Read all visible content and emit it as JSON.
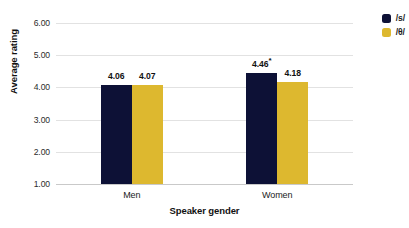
{
  "chart_data": {
    "type": "bar",
    "title": "",
    "xlabel": "Speaker gender",
    "ylabel": "Average rating",
    "categories": [
      "Men",
      "Women"
    ],
    "series": [
      {
        "name": "/s/",
        "color": "#0d1136",
        "values": [
          4.06,
          4.07
        ],
        "labels": [
          "4.06",
          "4.07"
        ],
        "annotations": [
          null,
          null
        ]
      },
      {
        "name": "/θ/",
        "color": "#ddb82f",
        "values": [
          4.07,
          4.18
        ],
        "labels": [
          "4.07",
          "4.18"
        ],
        "annotations": [
          null,
          null
        ]
      }
    ],
    "bars": [
      {
        "category": "Men",
        "series": "/s/",
        "value": 4.06,
        "label": "4.06",
        "star": ""
      },
      {
        "category": "Men",
        "series": "/θ/",
        "value": 4.07,
        "label": "4.07",
        "star": ""
      },
      {
        "category": "Women",
        "series": "/s/",
        "value": 4.46,
        "label": "4.46",
        "star": "*"
      },
      {
        "category": "Women",
        "series": "/θ/",
        "value": 4.18,
        "label": "4.18",
        "star": ""
      }
    ],
    "ylim": [
      1.0,
      6.0
    ],
    "yticks": [
      6.0,
      5.0,
      4.0,
      3.0,
      2.0,
      1.0
    ],
    "ytick_labels": [
      "6.00",
      "5.00",
      "4.00",
      "3.00",
      "2.00",
      "1.00"
    ],
    "grid": true,
    "legend_position": "top-right",
    "legend": [
      {
        "label": "/s/",
        "color": "#0d1136"
      },
      {
        "label": "/θ/",
        "color": "#ddb82f"
      }
    ],
    "background_color": "#ffffff",
    "gridline_color": "#e2e2e2",
    "significance_note": "*"
  }
}
